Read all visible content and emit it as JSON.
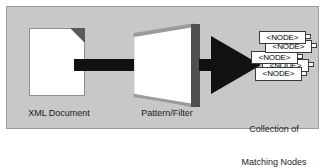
{
  "diagram": {
    "background_color": "#c8c8c8",
    "border_color": "#9a9a9a",
    "stages": [
      {
        "id": "xml-document",
        "caption": "XML Document",
        "icon": "document-icon"
      },
      {
        "id": "pattern-filter",
        "caption": "Pattern/Filter",
        "icon": "filter-screen-icon"
      },
      {
        "id": "matching-nodes",
        "caption_line1": "Collection of",
        "caption_line2": "Matching Nodes",
        "icon": "node-stack-icon"
      }
    ],
    "connectors": [
      {
        "id": "bar-connector",
        "type": "bar",
        "color": "#111111"
      },
      {
        "id": "arrow-connector",
        "type": "arrow",
        "color": "#111111"
      }
    ],
    "nodes": [
      {
        "label": "<NODE>"
      },
      {
        "label": "<NODE>"
      },
      {
        "label": "<NODE>"
      },
      {
        "label": "<NODE>"
      },
      {
        "label": "<NODE>"
      }
    ]
  }
}
